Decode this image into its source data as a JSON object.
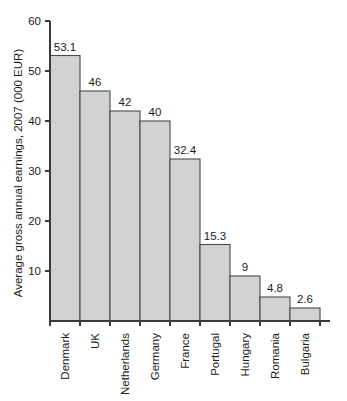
{
  "chart_data": {
    "type": "bar",
    "title": "",
    "xlabel": "",
    "ylabel": "Average gross annual earnings, 2007 (000 EUR)",
    "categories": [
      "Denmark",
      "UK",
      "Netherlands",
      "Germany",
      "France",
      "Portugal",
      "Hungary",
      "Romania",
      "Bulgaria"
    ],
    "values": [
      53.1,
      46,
      42,
      40,
      32.4,
      15.3,
      9,
      4.8,
      2.6
    ],
    "value_labels": [
      "53.1",
      "46",
      "42",
      "40",
      "32.4",
      "15.3",
      "9",
      "4.8",
      "2.6"
    ],
    "ylim": [
      0,
      60
    ],
    "yticks": [
      10,
      20,
      30,
      40,
      50,
      60
    ],
    "ytick_labels": [
      "10",
      "20",
      "30",
      "40",
      "50",
      "60"
    ],
    "grid": false,
    "legend": false,
    "legend_position": "none",
    "bar_fill_color": "#d2d2d2",
    "bar_border_color": "#4a4a4a",
    "axis_color": "#3a3a3a",
    "text_color": "#1c1c1c",
    "background_color": "#ffffff",
    "units": "000 EUR",
    "orientation": "vertical",
    "bars_adjacent": true
  }
}
